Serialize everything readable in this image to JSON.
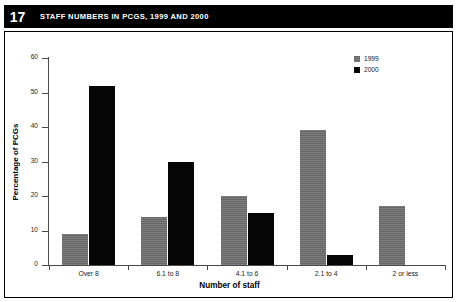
{
  "figure": {
    "number": "17",
    "title": "STAFF NUMBERS IN PCGS, 1999 AND 2000"
  },
  "chart_data": {
    "type": "bar",
    "title": "STAFF NUMBERS IN PCGS, 1999 AND 2000",
    "xlabel": "Number of staff",
    "ylabel": "Percentage of PCGs",
    "categories": [
      "Over 8",
      "6.1 to 8",
      "4.1 to 6",
      "2.1 to 4",
      "2 or less"
    ],
    "series": [
      {
        "name": "1999",
        "color": "#6f6f6f",
        "values": [
          9,
          14,
          20,
          39,
          17
        ]
      },
      {
        "name": "2000",
        "color": "#050505",
        "values": [
          52,
          30,
          15,
          3,
          0
        ]
      }
    ],
    "ylim": [
      0,
      60
    ],
    "yticks": [
      0,
      10,
      20,
      30,
      40,
      50,
      60
    ],
    "ytick_labels": [
      "0",
      "10",
      "20",
      "30",
      "40",
      "50",
      "60"
    ],
    "grid": false,
    "legend_position": "top-right"
  }
}
